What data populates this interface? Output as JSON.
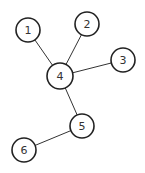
{
  "diagram": {
    "type": "tree-graph",
    "width": 145,
    "height": 173,
    "nodes": [
      {
        "id": "1",
        "label": "1",
        "x": 28,
        "y": 30,
        "r": 12
      },
      {
        "id": "2",
        "label": "2",
        "x": 87,
        "y": 24,
        "r": 12
      },
      {
        "id": "3",
        "label": "3",
        "x": 123,
        "y": 60,
        "r": 12
      },
      {
        "id": "4",
        "label": "4",
        "x": 60,
        "y": 76,
        "r": 13
      },
      {
        "id": "5",
        "label": "5",
        "x": 82,
        "y": 126,
        "r": 12
      },
      {
        "id": "6",
        "label": "6",
        "x": 24,
        "y": 150,
        "r": 12
      }
    ],
    "edges": [
      {
        "from": "1",
        "to": "4"
      },
      {
        "from": "2",
        "to": "4"
      },
      {
        "from": "3",
        "to": "4"
      },
      {
        "from": "4",
        "to": "5"
      },
      {
        "from": "5",
        "to": "6"
      }
    ],
    "colors": {
      "background": "#ffffff",
      "stroke": "#222222",
      "text": "#333333"
    }
  }
}
